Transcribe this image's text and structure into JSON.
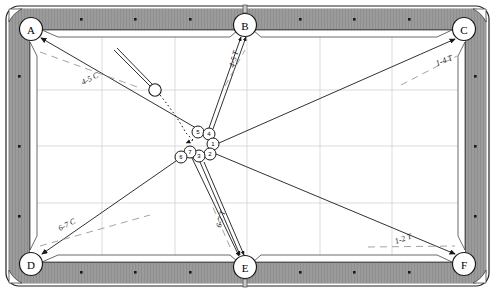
{
  "diagram": {
    "type": "pool-table-layout"
  },
  "table": {
    "frame_color": "#7c7c7c",
    "rail_color": "#9a9a9a",
    "cloth_color": "#ffffff",
    "grid_color": "#d0d0d0",
    "line_color": "#1a1a1a",
    "outer": {
      "x": 6,
      "y": 6,
      "w": 483,
      "h": 280
    },
    "rail_inner": {
      "x": 30,
      "y": 30,
      "w": 435,
      "h": 232
    }
  },
  "pockets": [
    {
      "id": "A",
      "label": "A",
      "cx": 31,
      "cy": 29,
      "kind": "corner"
    },
    {
      "id": "B",
      "label": "B",
      "cx": 245,
      "cy": 25,
      "kind": "side"
    },
    {
      "id": "C",
      "label": "C",
      "cx": 464,
      "cy": 29,
      "kind": "corner"
    },
    {
      "id": "D",
      "label": "D",
      "cx": 31,
      "cy": 264,
      "kind": "corner"
    },
    {
      "id": "E",
      "label": "E",
      "cx": 245,
      "cy": 267,
      "kind": "side"
    },
    {
      "id": "F",
      "label": "F",
      "cx": 464,
      "cy": 264,
      "kind": "corner"
    }
  ],
  "diamonds": {
    "top": [
      81,
      135,
      190,
      300,
      354,
      409
    ],
    "bottom": [
      81,
      135,
      190,
      300,
      354,
      409
    ],
    "left": [
      76,
      146,
      216
    ],
    "right": [
      76,
      146,
      216
    ]
  },
  "balls": [
    {
      "num": "5",
      "cx": 198,
      "cy": 132,
      "r": 6
    },
    {
      "num": "4",
      "cx": 209,
      "cy": 134,
      "r": 6
    },
    {
      "num": "1",
      "cx": 213,
      "cy": 144,
      "r": 6
    },
    {
      "num": "2",
      "cx": 210,
      "cy": 154,
      "r": 6
    },
    {
      "num": "3",
      "cx": 199,
      "cy": 156,
      "r": 6
    },
    {
      "num": "7",
      "cx": 190,
      "cy": 152,
      "r": 6
    },
    {
      "num": "6",
      "cx": 181,
      "cy": 157,
      "r": 6
    }
  ],
  "cue_ball": {
    "cx": 155,
    "cy": 90,
    "r": 6,
    "label": "cue-ball"
  },
  "cue_stick": {
    "x1": 116,
    "y1": 51,
    "x2": 150,
    "y2": 86
  },
  "shot_labels": [
    {
      "id": "label-45C",
      "text": "4-5 C",
      "x": 83,
      "y": 85,
      "rotate": -27
    },
    {
      "id": "label-45T",
      "text": "4-5 T",
      "x": 234,
      "y": 68,
      "rotate": -75
    },
    {
      "id": "label-14T",
      "text": "1-4 T",
      "x": 441,
      "y": 65,
      "rotate": -21
    },
    {
      "id": "label-67C",
      "text": "6-7 C",
      "x": 62,
      "y": 230,
      "rotate": -27
    },
    {
      "id": "label-67T",
      "text": "6-7 T",
      "x": 222,
      "y": 227,
      "rotate": -75
    },
    {
      "id": "label-12T",
      "text": "1-2 T",
      "x": 400,
      "y": 243,
      "rotate": -20
    }
  ],
  "shot_lines": [
    {
      "id": "line-5-to-A",
      "from": "ball5",
      "to": "pocketA"
    },
    {
      "id": "line-4-to-B",
      "from": "ball4",
      "to": "pocketB"
    },
    {
      "id": "line-1-to-C",
      "from": "ball1",
      "to": "pocketC"
    },
    {
      "id": "line-2-to-F",
      "from": "ball2",
      "to": "pocketF"
    },
    {
      "id": "line-3-to-E",
      "from": "ball3",
      "to": "pocketE"
    },
    {
      "id": "line-7-to-E",
      "from": "ball7",
      "to": "pocketE"
    },
    {
      "id": "line-6-to-D",
      "from": "ball6",
      "to": "pocketD"
    }
  ],
  "cue_path": {
    "id": "cue-ball-path",
    "style": "dotted",
    "from": "cue-ball",
    "to": "contact-point"
  }
}
